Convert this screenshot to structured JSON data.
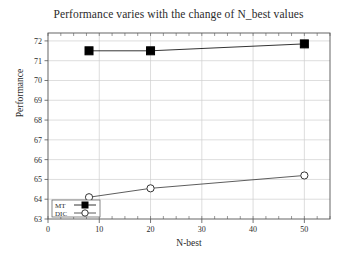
{
  "chart_data": {
    "type": "line",
    "title": "Performance varies with the change of N_best values",
    "xlabel": "N-best",
    "ylabel": "Performance",
    "xlim": [
      0,
      55
    ],
    "ylim": [
      63,
      72.4
    ],
    "xticks": [
      0,
      10,
      20,
      30,
      40,
      50
    ],
    "yticks": [
      63,
      64,
      65,
      66,
      67,
      68,
      69,
      70,
      71,
      72
    ],
    "grid": true,
    "legend_position": "bottom-left",
    "x": [
      8,
      20,
      50
    ],
    "series": [
      {
        "name": "MT",
        "marker": "filled-square",
        "values": [
          71.5,
          71.5,
          71.85
        ]
      },
      {
        "name": "DIC",
        "marker": "open-circle",
        "values": [
          64.1,
          64.55,
          65.2
        ]
      }
    ]
  },
  "axis": {
    "xtick_labels": [
      "0",
      "10",
      "20",
      "30",
      "40",
      "50"
    ],
    "ytick_labels": [
      "63",
      "64",
      "65",
      "66",
      "67",
      "68",
      "69",
      "70",
      "71",
      "72"
    ]
  },
  "legend": {
    "items": [
      {
        "label": "MT"
      },
      {
        "label": "DIC"
      }
    ]
  },
  "colors": {
    "series_mt": "#000000",
    "series_dic": "#333333",
    "grid": "#cfcfcf",
    "axis": "#555555",
    "text": "#2b2b2b",
    "background": "#ffffff"
  }
}
